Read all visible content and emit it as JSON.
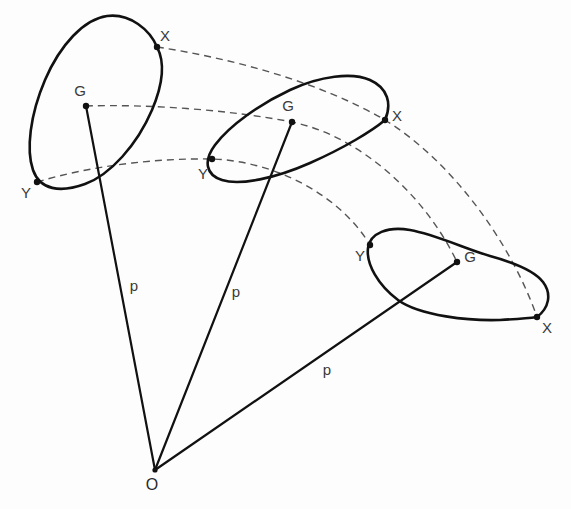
{
  "figure": {
    "type": "mechanics-diagram",
    "background_color": "#fdfdfd",
    "stroke_color": "#111111",
    "dashed_color": "#555555",
    "label_color": "#3a3a3a",
    "width": 571,
    "height": 509
  },
  "origin": {
    "label": "O",
    "x": 155,
    "y": 470,
    "label_x": 152,
    "label_y": 486,
    "dot_radius": 2.6
  },
  "bodies": [
    {
      "name": "body-position-1",
      "outline_path": "M 157 47 C 150 30, 130 13, 107 16 C 84 19, 60 45, 45 80 C 30 115, 26 150, 33 170 C 40 190, 60 193, 85 184 C 110 175, 137 145, 152 110 C 163 84, 165 62, 157 47 Z",
      "points": [
        {
          "label": "X",
          "x": 157,
          "y": 47,
          "label_x": 165,
          "label_y": 37
        },
        {
          "label": "G",
          "x": 86,
          "y": 106,
          "label_x": 80,
          "label_y": 92
        },
        {
          "label": "Y",
          "x": 37,
          "y": 182,
          "label_x": 26,
          "label_y": 194
        }
      ]
    },
    {
      "name": "body-position-2",
      "outline_path": "M 385 120 C 392 104, 388 88, 370 80 C 352 72, 320 76, 290 90 C 260 104, 230 125, 215 145 C 203 161, 206 175, 222 180 C 240 186, 276 178, 310 163 C 344 148, 372 131, 385 120 Z",
      "points": [
        {
          "label": "X",
          "x": 385,
          "y": 120,
          "label_x": 397,
          "label_y": 117
        },
        {
          "label": "G",
          "x": 292,
          "y": 122,
          "label_x": 288,
          "label_y": 107
        },
        {
          "label": "Y",
          "x": 212,
          "y": 159,
          "label_x": 203,
          "label_y": 175
        }
      ]
    },
    {
      "name": "body-position-3",
      "outline_path": "M 537 317 C 549 308, 552 294, 543 282 C 534 270, 512 262, 490 256 C 466 249, 434 234, 410 230 C 388 226, 370 233, 368 248 C 366 264, 378 285, 398 300 C 420 316, 470 321, 500 320 C 518 319, 530 318, 537 317 Z",
      "points": [
        {
          "label": "Y",
          "x": 370,
          "y": 245,
          "label_x": 360,
          "label_y": 257
        },
        {
          "label": "G",
          "x": 457,
          "y": 262,
          "label_x": 470,
          "label_y": 258
        },
        {
          "label": "X",
          "x": 537,
          "y": 317,
          "label_x": 547,
          "label_y": 329
        }
      ]
    }
  ],
  "trajectories": [
    {
      "name": "arc-through-X",
      "tracked_point": "X",
      "path": "M 157 47 C 230 58, 320 82, 385 120 C 450 160, 510 240, 537 317"
    },
    {
      "name": "arc-through-G",
      "tracked_point": "G",
      "path": "M 86 106 C 150 104, 230 110, 292 122 C 360 136, 425 195, 457 262"
    },
    {
      "name": "arc-through-Y",
      "tracked_point": "Y",
      "path": "M 37 182 C 90 166, 155 158, 212 159 C 275 161, 340 195, 370 245"
    }
  ],
  "radii": [
    {
      "name": "radius-to-G1",
      "label": "p",
      "from": {
        "x": 155,
        "y": 470
      },
      "to": {
        "x": 86,
        "y": 106
      },
      "label_x": 134,
      "label_y": 287
    },
    {
      "name": "radius-to-G2",
      "label": "p",
      "from": {
        "x": 155,
        "y": 470
      },
      "to": {
        "x": 292,
        "y": 122
      },
      "label_x": 236,
      "label_y": 293
    },
    {
      "name": "radius-to-G3",
      "label": "p",
      "from": {
        "x": 155,
        "y": 470
      },
      "to": {
        "x": 457,
        "y": 262
      },
      "label_x": 327,
      "label_y": 371
    }
  ]
}
